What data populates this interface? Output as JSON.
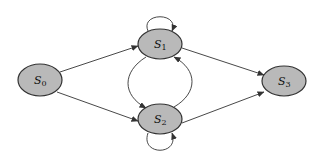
{
  "diagram": {
    "type": "state-transition",
    "nodes": [
      {
        "id": "S0",
        "label": "S",
        "sub": "0",
        "cx": 40,
        "cy": 80
      },
      {
        "id": "S1",
        "label": "S",
        "sub": "1",
        "cx": 160,
        "cy": 44
      },
      {
        "id": "S2",
        "label": "S",
        "sub": "2",
        "cx": 160,
        "cy": 119
      },
      {
        "id": "S3",
        "label": "S",
        "sub": "3",
        "cx": 284,
        "cy": 81
      }
    ],
    "edges": [
      {
        "from": "S0",
        "to": "S1"
      },
      {
        "from": "S0",
        "to": "S2"
      },
      {
        "from": "S1",
        "to": "S3"
      },
      {
        "from": "S2",
        "to": "S3"
      },
      {
        "from": "S1",
        "to": "S1",
        "kind": "self-loop"
      },
      {
        "from": "S2",
        "to": "S2",
        "kind": "self-loop"
      },
      {
        "from": "S1",
        "to": "S2",
        "kind": "curved-left"
      },
      {
        "from": "S2",
        "to": "S1",
        "kind": "curved-right"
      }
    ],
    "colors": {
      "node_fill": "#b9b9b9",
      "stroke": "#333333"
    }
  }
}
